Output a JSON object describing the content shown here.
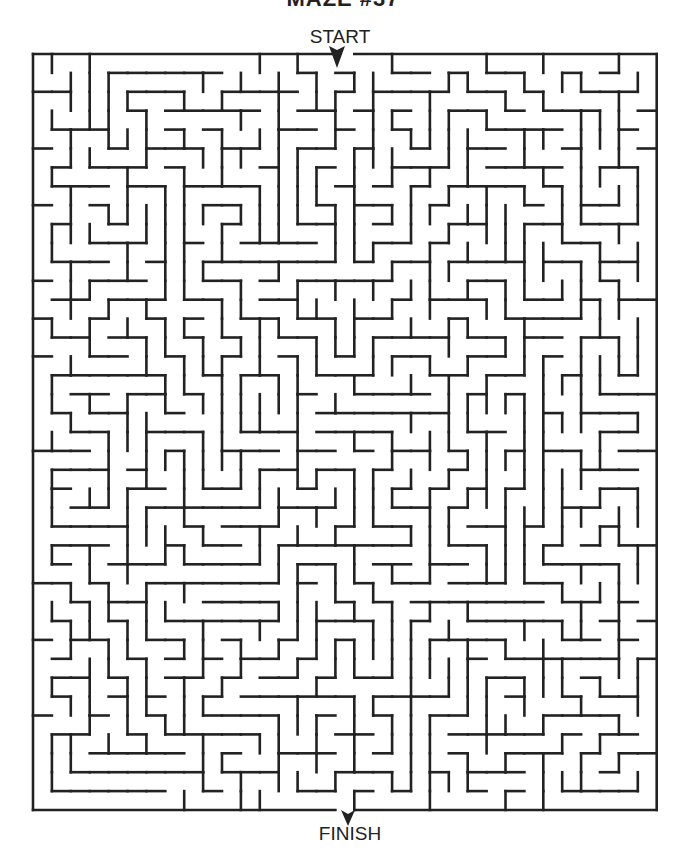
{
  "title_partial": "MAZE #37",
  "labels": {
    "start": "START",
    "finish": "FINISH"
  },
  "maze": {
    "left": 33,
    "top": 54,
    "cols": 33,
    "rows": 40,
    "cell": 18.9,
    "stroke": 2.6,
    "wall_color": "#222222",
    "start_col": 16,
    "finish_col": 16,
    "seed": 37
  },
  "arrows": {
    "start": {
      "x": 337,
      "y": 50
    },
    "finish": {
      "x": 348,
      "y": 812
    }
  },
  "icons": {
    "start_arrow": "arrow-down-icon",
    "finish_arrow": "arrow-down-icon"
  }
}
